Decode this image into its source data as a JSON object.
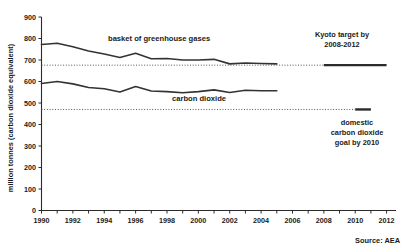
{
  "chart_data": {
    "type": "line",
    "title": "",
    "xlabel": "",
    "ylabel": "million tonnes (carbon dioxide equivalent)",
    "xlim": [
      1990,
      2012.6
    ],
    "ylim": [
      0,
      900
    ],
    "grid": false,
    "legend_position": "inline-annotations",
    "source": "Source: AEA",
    "y_ticks": [
      0,
      100,
      200,
      300,
      400,
      500,
      600,
      700,
      800,
      900
    ],
    "y_tick_labels": [
      "0",
      "100",
      "200",
      "300",
      "400",
      "500",
      "600",
      "700",
      "800",
      "900"
    ],
    "x_ticks": [
      1990,
      1991,
      1992,
      1993,
      1994,
      1995,
      1996,
      1997,
      1998,
      1999,
      2000,
      2001,
      2002,
      2003,
      2004,
      2005,
      2006,
      2007,
      2008,
      2009,
      2010,
      2011,
      2012
    ],
    "x_tick_labels_shown": [
      "1990",
      "1992",
      "1994",
      "1996",
      "1998",
      "2000",
      "2002",
      "2004",
      "2006",
      "2008",
      "2010",
      "2012"
    ],
    "x": [
      1990,
      1991,
      1992,
      1993,
      1994,
      1995,
      1996,
      1997,
      1998,
      1999,
      2000,
      2001,
      2002,
      2003,
      2004,
      2005
    ],
    "series": [
      {
        "name": "basket of greenhouse gases",
        "label": "basket of greenhouse gases",
        "color": "#333333",
        "values": [
          772,
          778,
          762,
          742,
          728,
          712,
          731,
          706,
          707,
          700,
          700,
          703,
          682,
          686,
          684,
          682
        ]
      },
      {
        "name": "carbon dioxide",
        "label": "carbon dioxide",
        "color": "#333333",
        "values": [
          591,
          600,
          589,
          572,
          566,
          551,
          577,
          556,
          553,
          548,
          553,
          561,
          549,
          559,
          557,
          557
        ]
      }
    ],
    "reference_lines": [
      {
        "name": "kyoto-target-reference",
        "label": "Kyoto target by 2008-2012",
        "value": 676,
        "style": "dotted",
        "segment_years": [
          2008,
          2012
        ]
      },
      {
        "name": "domestic-co2-goal-reference",
        "label": "domestic carbon dioxide goal by 2010",
        "value": 470,
        "style": "dotted",
        "segment_years": [
          2010,
          2011
        ]
      }
    ],
    "annotations": [
      {
        "name": "kyoto-target-annotation",
        "line1": "Kyoto target by",
        "line2": "2008-2012"
      },
      {
        "name": "domestic-goal-annotation",
        "line1": "domestic",
        "line2": "carbon dioxide",
        "line3": "goal by 2010"
      }
    ]
  },
  "colors": {
    "axis": "#2b2b2b",
    "series": "#333333",
    "reference": "#555555",
    "background": "#ffffff"
  }
}
